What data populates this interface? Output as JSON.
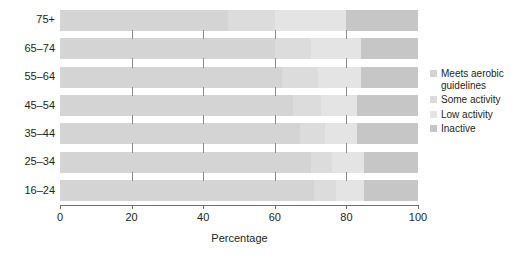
{
  "chart_data": {
    "type": "bar",
    "orientation": "horizontal",
    "stacked": true,
    "stack_mode": "percent",
    "title": "",
    "xlabel": "Percentage",
    "ylabel": "",
    "xlim": [
      0,
      100
    ],
    "xticks": [
      0,
      20,
      40,
      60,
      80,
      100
    ],
    "xtick_labels": [
      "0",
      "20",
      "40",
      "60",
      "80",
      "100"
    ],
    "grid": false,
    "legend_position": "right",
    "categories": [
      "75+",
      "65–74",
      "55–64",
      "45–54",
      "35–44",
      "25–34",
      "16–24"
    ],
    "series": [
      {
        "name": "Meets aerobic guidelines",
        "color": "#d4d4d4",
        "values": [
          47,
          60,
          62,
          65,
          67,
          70,
          71
        ]
      },
      {
        "name": "Some activity",
        "color": "#dcdcdc",
        "values": [
          13,
          10,
          10,
          8,
          7,
          6,
          6
        ]
      },
      {
        "name": "Low activity",
        "color": "#e4e4e4",
        "values": [
          20,
          14,
          12,
          10,
          9,
          9,
          8
        ]
      },
      {
        "name": "Inactive",
        "color": "#c6c6c6",
        "values": [
          20,
          16,
          16,
          17,
          17,
          15,
          15
        ]
      }
    ]
  },
  "legend": {
    "items": [
      {
        "label": "Meets aerobic guidelines",
        "color": "#d4d4d4"
      },
      {
        "label": "Some activity",
        "color": "#dcdcdc"
      },
      {
        "label": "Low activity",
        "color": "#e4e4e4"
      },
      {
        "label": "Inactive",
        "color": "#c6c6c6"
      }
    ]
  },
  "axis": {
    "x_title": "Percentage",
    "x_tick_labels": [
      "0",
      "20",
      "40",
      "60",
      "80",
      "100"
    ],
    "y_tick_labels": [
      "75+",
      "65–74",
      "55–64",
      "45–54",
      "35–44",
      "25–34",
      "16–24"
    ]
  }
}
